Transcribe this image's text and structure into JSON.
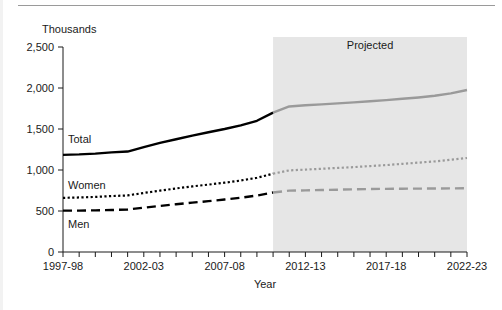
{
  "chart_data": {
    "type": "line",
    "title": "",
    "units_label": "Thousands",
    "xlabel": "Year",
    "ylabel": "",
    "ylim": [
      0,
      2500
    ],
    "yticks": [
      "0",
      "500",
      "1,000",
      "1,500",
      "2,000",
      "2,500"
    ],
    "ytick_values": [
      0,
      500,
      1000,
      1500,
      2000,
      2500
    ],
    "grid": false,
    "legend_position": "inline-labels",
    "annotations": [
      {
        "name": "projected-band-label",
        "text": "Projected",
        "x_start": "2010-11",
        "x_end": "2022-23"
      }
    ],
    "x": [
      "1997-98",
      "1998-99",
      "1999-2000",
      "2000-01",
      "2001-02",
      "2002-03",
      "2003-04",
      "2004-05",
      "2005-06",
      "2006-07",
      "2007-08",
      "2008-09",
      "2009-10",
      "2010-11",
      "2011-12",
      "2012-13",
      "2013-14",
      "2014-15",
      "2015-16",
      "2016-17",
      "2017-18",
      "2018-19",
      "2019-20",
      "2020-21",
      "2021-22",
      "2022-23"
    ],
    "xtick_labels": [
      "1997-98",
      "2002-03",
      "2007-08",
      "2012-13",
      "2017-18",
      "2022-23"
    ],
    "xtick_label_indices": [
      0,
      5,
      10,
      15,
      20,
      25
    ],
    "projection_start_index": 13,
    "series": [
      {
        "name": "Total",
        "label": "Total",
        "color_historical": "#000000",
        "color_projected": "#9a9a9a",
        "style": "solid",
        "values": [
          1185,
          1190,
          1200,
          1215,
          1225,
          1280,
          1330,
          1375,
          1420,
          1460,
          1500,
          1545,
          1600,
          1700,
          1775,
          1790,
          1800,
          1812,
          1825,
          1838,
          1852,
          1868,
          1885,
          1905,
          1935,
          1975
        ]
      },
      {
        "name": "Women",
        "label": "Women",
        "color_historical": "#000000",
        "color_projected": "#9a9a9a",
        "style": "dotted",
        "values": [
          660,
          665,
          672,
          682,
          690,
          720,
          748,
          775,
          800,
          822,
          845,
          872,
          905,
          955,
          995,
          1005,
          1015,
          1025,
          1035,
          1048,
          1060,
          1075,
          1090,
          1105,
          1125,
          1146
        ]
      },
      {
        "name": "Men",
        "label": "Men",
        "color_historical": "#000000",
        "color_projected": "#9a9a9a",
        "style": "dashed",
        "values": [
          505,
          505,
          508,
          512,
          518,
          540,
          562,
          582,
          602,
          620,
          640,
          662,
          688,
          725,
          748,
          752,
          756,
          760,
          764,
          768,
          770,
          772,
          773,
          774,
          776,
          778
        ]
      }
    ]
  },
  "colors": {
    "historical": "#000000",
    "projected": "#9a9a9a",
    "band": "#e6e6e6",
    "axis": "#1a1a1a",
    "rule": "#9a9a9a"
  }
}
